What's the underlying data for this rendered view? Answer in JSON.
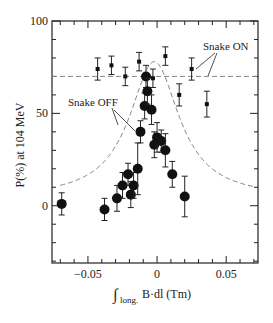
{
  "chart_data": {
    "type": "scatter",
    "title": "",
    "xlabel": "∫long. B·dl (Tm)",
    "xlabel_main": "B·dl (Tm)",
    "xlabel_sub": "long.",
    "ylabel": "P(%) at 104 MeV",
    "xlim": [
      -0.076,
      0.073
    ],
    "ylim": [
      -31,
      100
    ],
    "x_ticks": [
      -0.05,
      0,
      0.05
    ],
    "x_tick_labels": [
      "−0.05",
      "0",
      "0.05"
    ],
    "y_ticks": [
      0,
      50,
      100
    ],
    "y_tick_labels": [
      "0",
      "50",
      "100"
    ],
    "grid": false,
    "annotations": [
      {
        "text": "Snake ON",
        "x": 0.032,
        "y": 84
      },
      {
        "text": "Snake OFF",
        "x": -0.034,
        "y": 56
      }
    ],
    "series": [
      {
        "name": "Snake ON",
        "marker": "square-small",
        "points": [
          {
            "x": -0.043,
            "y": 74,
            "err": 6
          },
          {
            "x": -0.033,
            "y": 76,
            "err": 5
          },
          {
            "x": -0.023,
            "y": 70,
            "err": 5
          },
          {
            "x": -0.013,
            "y": 78,
            "err": 5
          },
          {
            "x": -0.003,
            "y": 69,
            "err": 5
          },
          {
            "x": 0.006,
            "y": 81,
            "err": 5
          },
          {
            "x": 0.016,
            "y": 60,
            "err": 6
          },
          {
            "x": 0.025,
            "y": 74,
            "err": 6
          },
          {
            "x": 0.036,
            "y": 55,
            "err": 7
          }
        ]
      },
      {
        "name": "Snake OFF",
        "marker": "circle-large",
        "points": [
          {
            "x": -0.069,
            "y": 1,
            "err": 6
          },
          {
            "x": -0.038,
            "y": -2,
            "err": 6
          },
          {
            "x": -0.029,
            "y": 4,
            "err": 7
          },
          {
            "x": -0.025,
            "y": 11,
            "err": 7
          },
          {
            "x": -0.021,
            "y": 17,
            "err": 6
          },
          {
            "x": -0.019,
            "y": 6,
            "err": 7
          },
          {
            "x": -0.017,
            "y": 11,
            "err": 7
          },
          {
            "x": -0.014,
            "y": 20,
            "err": 14
          },
          {
            "x": -0.012,
            "y": 40,
            "err": 6
          },
          {
            "x": -0.009,
            "y": 54,
            "err": 7
          },
          {
            "x": -0.008,
            "y": 70,
            "err": 6
          },
          {
            "x": -0.007,
            "y": 62,
            "err": 7
          },
          {
            "x": -0.004,
            "y": 52,
            "err": 8
          },
          {
            "x": -0.002,
            "y": 33,
            "err": 7
          },
          {
            "x": 0.0,
            "y": 37,
            "err": 8
          },
          {
            "x": 0.003,
            "y": 35,
            "err": 6
          },
          {
            "x": 0.006,
            "y": 30,
            "err": 9
          },
          {
            "x": 0.011,
            "y": 17,
            "err": 7
          },
          {
            "x": 0.02,
            "y": 5,
            "err": 11
          }
        ]
      },
      {
        "name": "Snake ON fit",
        "type": "line",
        "style": "dashed",
        "points": [
          {
            "x": -0.076,
            "y": 70
          },
          {
            "x": 0.073,
            "y": 70
          }
        ]
      },
      {
        "name": "Snake OFF fit",
        "type": "line",
        "style": "dashed",
        "shape": "lorentzian",
        "peak_x": -0.002,
        "peak_y": 78,
        "points": [
          {
            "x": -0.07,
            "y": 10
          },
          {
            "x": -0.05,
            "y": 19
          },
          {
            "x": -0.035,
            "y": 34
          },
          {
            "x": -0.025,
            "y": 48
          },
          {
            "x": -0.015,
            "y": 67
          },
          {
            "x": -0.008,
            "y": 76
          },
          {
            "x": -0.002,
            "y": 78
          },
          {
            "x": 0.005,
            "y": 74
          },
          {
            "x": 0.012,
            "y": 62
          },
          {
            "x": 0.02,
            "y": 47
          },
          {
            "x": 0.03,
            "y": 32
          },
          {
            "x": 0.045,
            "y": 20
          },
          {
            "x": 0.06,
            "y": 14
          },
          {
            "x": 0.073,
            "y": 11
          }
        ]
      }
    ]
  }
}
